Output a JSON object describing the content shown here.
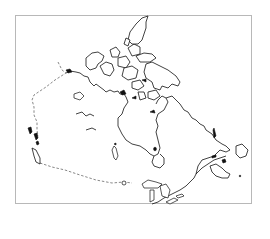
{
  "map": {
    "title": "Outline map of Canada",
    "country": "Canada",
    "style": "black coastline outline on white, dashed land borders",
    "colors": {
      "background": "#ffffff",
      "frame": "#b8b8b8",
      "coastline": "#111111",
      "border_dashed": "#555555"
    },
    "features": [
      {
        "name": "Arctic Archipelago",
        "type": "islands"
      },
      {
        "name": "Hudson Bay",
        "type": "bay"
      },
      {
        "name": "Great Lakes",
        "type": "lakes"
      },
      {
        "name": "Newfoundland",
        "type": "island"
      },
      {
        "name": "Vancouver Island",
        "type": "island"
      },
      {
        "name": "Alaska border",
        "type": "land-border-dashed"
      },
      {
        "name": "United States border",
        "type": "land-border-dashed"
      }
    ]
  }
}
